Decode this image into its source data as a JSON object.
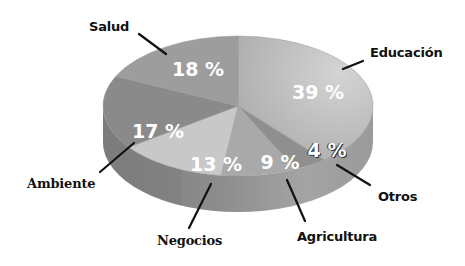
{
  "chart_data": {
    "type": "pie",
    "style": "3d",
    "title": "",
    "categories": [
      "Educación",
      "Otros",
      "Agricultura",
      "Negocios",
      "Ambiente",
      "Salud"
    ],
    "values": [
      39,
      4,
      9,
      13,
      17,
      18
    ],
    "value_labels": [
      "39 %",
      "4 %",
      "9 %",
      "13 %",
      "17 %",
      "18 %"
    ],
    "colors": [
      "#b9b9b9",
      "#8f8f8f",
      "#a9a9a9",
      "#c8c8c8",
      "#8a8a8a",
      "#9d9d9d"
    ],
    "legend": "none (leader-line callouts)",
    "grid": false
  },
  "labels": {
    "educacion": "Educación",
    "otros": "Otros",
    "agricultura": "Agricultura",
    "negocios": "Negocios",
    "ambiente": "Ambiente",
    "salud": "Salud"
  },
  "percents": {
    "educacion": "39 %",
    "otros": "4 %",
    "agricultura": "9 %",
    "negocios": "13 %",
    "ambiente": "17 %",
    "salud": "18 %"
  }
}
